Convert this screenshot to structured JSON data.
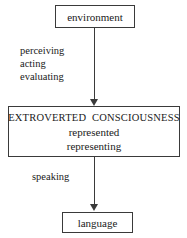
{
  "diagram": {
    "type": "flowchart",
    "background_color": "#ffffff",
    "stroke_color": "#3a3a3a",
    "text_color": "#1a1a1a",
    "nodes": [
      {
        "id": "environment",
        "label": "environment",
        "shape": "rectangle"
      },
      {
        "id": "extroverted-consciousness",
        "title": "EXTROVERTED  CONSCIOUSNESS",
        "line2": "represented",
        "line3": "representing",
        "shape": "rectangle"
      },
      {
        "id": "language",
        "label": "language",
        "shape": "rectangle"
      }
    ],
    "edges": [
      {
        "id": "environment-to-consciousness",
        "from": "environment",
        "to": "extroverted-consciousness",
        "direction": "down",
        "arrowhead": "solid-triangle",
        "labels": [
          "perceiving",
          "acting",
          "evaluating"
        ]
      },
      {
        "id": "consciousness-to-language",
        "from": "extroverted-consciousness",
        "to": "language",
        "direction": "down",
        "arrowhead": "solid-triangle",
        "labels": [
          "speaking"
        ]
      }
    ]
  }
}
